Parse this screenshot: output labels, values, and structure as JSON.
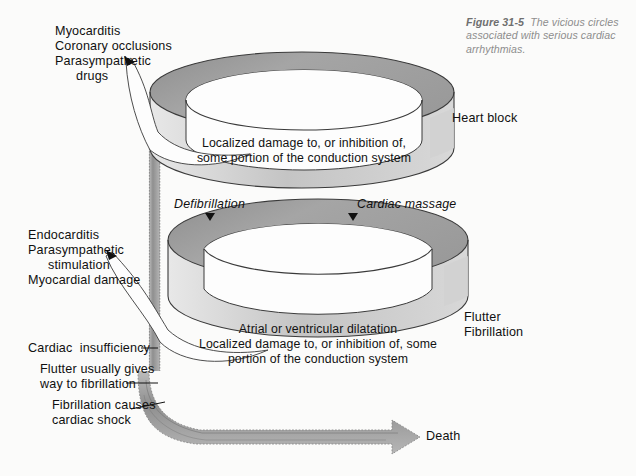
{
  "figure": {
    "caption_label": "Figure 31-5",
    "caption_text": "The vicious circles",
    "caption_line2": "associated with serious cardiac",
    "caption_line3": "arrhythmias."
  },
  "colors": {
    "background": "#fbfbfa",
    "ring_top_fill": "#a2a2a2",
    "ring_side_fill": "#c9c9c9",
    "ring_inner_fill": "#fcfcfc",
    "band_fill": "#9d9d9d",
    "stroke": "#2b2b2b",
    "text": "#101010",
    "caption_text": "#8d8d8d"
  },
  "upper_circle": {
    "causes": {
      "line1": "Myocarditis",
      "line2": "Coronary occlusions",
      "line3": "Parasympathetic",
      "line4": "drugs"
    },
    "ring_text": {
      "line1": "Localized damage to, or inhibition of,",
      "line2": "some portion of the conduction system"
    },
    "outcome": "Heart block"
  },
  "interventions": {
    "left": "Defibrillation",
    "right": "Cardiac massage"
  },
  "lower_circle": {
    "causes": {
      "line1": "Endocarditis",
      "line2": "Parasympathetic",
      "line3": "stimulation",
      "line4": "Myocardial damage"
    },
    "ring_text": {
      "line1": "Atrial or ventricular dilatation",
      "line2": "Localized damage to, or inhibition of, some",
      "line3": "portion of the conduction system"
    },
    "outcome_line1": "Flutter",
    "outcome_line2": "Fibrillation"
  },
  "consequences": {
    "item1": "Cardiac  insufficiency",
    "item2_line1": "Flutter usually gives",
    "item2_line2": "way to fibrillation",
    "item3_line1": "Fibrillation causes",
    "item3_line2": "cardiac shock"
  },
  "terminal": {
    "label": "Death"
  }
}
